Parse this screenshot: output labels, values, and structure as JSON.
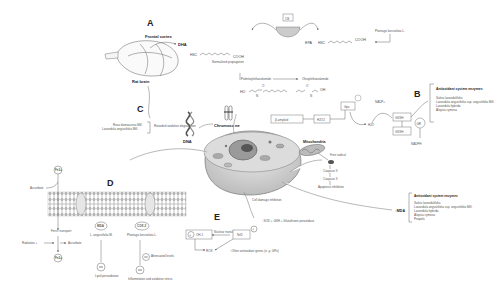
{
  "panels": {
    "A": {
      "label": "A",
      "frontal_cortex": "Frontal cortex",
      "dha": "DHA",
      "rat_brain": "Rat brain",
      "dha_formula_left": "H3C",
      "dha_formula_right": "COOH",
      "normalized_propagation": "Normalized propagation",
      "cb_label": "CB",
      "epa": "EPA",
      "epa_formula_left": "H3C",
      "epa_formula_right": "COOH",
      "source_plant": "Plantago lanceolata L.",
      "palmitoylethanolamide": "Palmitoylethanolamide",
      "oleoylethanolamide": "Oleoylethanolamide",
      "pea_formula": "HO—N—C(=O)—chain",
      "oea_formula": "chain—C(=O)—N—OH"
    },
    "B": {
      "label": "B",
      "beta_amyloid": "β-amyloid",
      "h2o2": "H2O2",
      "gpx": "Gpx",
      "h2o": "H2O",
      "gssh_top": "GSSH",
      "gssh_bottom": "GSSH",
      "gr": "GR",
      "nadp": "NADP+",
      "nadph": "NADPH",
      "enzymes_title": "Antioxidant system enzymes",
      "enzymes": [
        "Salvia lavandulifolia",
        "Lavandula angustifolia ssp. angustifolia Mill.",
        "Lavandula hybrida",
        "Aloysia cymosa"
      ]
    },
    "C": {
      "label": "C",
      "sources": [
        "Rosa damascena Mill.",
        "Lavandula angustifolia Mill."
      ],
      "effect": "Retarded oxidative degradation",
      "dna": "DNA",
      "chromosome": "Chromosome"
    },
    "D": {
      "label": "D",
      "fe3": "Fe3+",
      "fe2": "Fe2+",
      "ascorbate": "Ascorbate",
      "ferric_transport": "Ferric transport",
      "radiation": "Radiation +",
      "ascorbate2": "Ascorbate",
      "mda": "MDA",
      "mda_source": "L. angustifolia M.",
      "cox2": "COX-2",
      "cox2_source": "Plantago lanceolata L.",
      "lipid_peroxidation": "Lipid peroxidation",
      "inflammation": "Inflammation and oxidative stress",
      "attenuated": "Attenuated levels"
    },
    "E": {
      "label": "E",
      "ho1": "OH-1",
      "nuclear_translocation": "Nuclear translocation",
      "nrf2": "Nrf2",
      "ros": "ROS",
      "sod_line": "SOD + GSH + Glutathione peroxidase",
      "other_genes": "Other antioxidant genes (e. g. GPx)",
      "cell_damage": "Cell damage inhibition"
    },
    "mito": {
      "title": "Mitochondria",
      "free_radical": "Free radical",
      "caspase9": "Caspase 9",
      "caspase3": "Caspase 3",
      "apoptosis": "Apoptosis inhibition"
    },
    "right_box": {
      "mda": "MDA",
      "title": "Antioxidant system enzymes",
      "items": [
        "Salvia lavandulifolia",
        "Lavandula angustifolia ssp. angustifolia Mill.",
        "Lavandula hybrida",
        "Aloysia cymosa",
        "Propolis"
      ]
    }
  }
}
